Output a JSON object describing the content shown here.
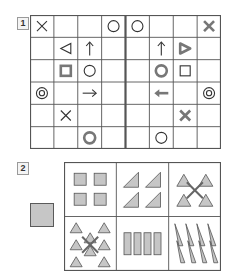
{
  "questions": [
    {
      "number": "1"
    },
    {
      "number": "2"
    }
  ],
  "colors": {
    "line": "#555555",
    "thin_symbol": "#333333",
    "bold_symbol": "#777777",
    "fill": "#c6c6c6"
  },
  "puzzle1": {
    "cols": 8,
    "rows": 6,
    "mirror_divider_after_col": 4,
    "cells": [
      {
        "r": 0,
        "c": 0,
        "sym": "x",
        "style": "thin"
      },
      {
        "r": 0,
        "c": 3,
        "sym": "circle",
        "style": "thin"
      },
      {
        "r": 0,
        "c": 4,
        "sym": "circle",
        "style": "thin"
      },
      {
        "r": 0,
        "c": 7,
        "sym": "x",
        "style": "bold"
      },
      {
        "r": 1,
        "c": 1,
        "sym": "triangle-left",
        "style": "thin"
      },
      {
        "r": 1,
        "c": 2,
        "sym": "arrow-up",
        "style": "thin"
      },
      {
        "r": 1,
        "c": 5,
        "sym": "arrow-up",
        "style": "thin"
      },
      {
        "r": 1,
        "c": 6,
        "sym": "triangle-right",
        "style": "bold"
      },
      {
        "r": 2,
        "c": 1,
        "sym": "square",
        "style": "bold"
      },
      {
        "r": 2,
        "c": 2,
        "sym": "circle",
        "style": "thin"
      },
      {
        "r": 2,
        "c": 5,
        "sym": "circle",
        "style": "bold"
      },
      {
        "r": 2,
        "c": 6,
        "sym": "square",
        "style": "thin"
      },
      {
        "r": 3,
        "c": 0,
        "sym": "double-circle",
        "style": "thin"
      },
      {
        "r": 3,
        "c": 2,
        "sym": "arrow-right",
        "style": "thin"
      },
      {
        "r": 3,
        "c": 5,
        "sym": "arrow-left",
        "style": "bold"
      },
      {
        "r": 3,
        "c": 7,
        "sym": "double-circle",
        "style": "thin"
      },
      {
        "r": 4,
        "c": 1,
        "sym": "x",
        "style": "thin"
      },
      {
        "r": 4,
        "c": 6,
        "sym": "x",
        "style": "bold"
      },
      {
        "r": 5,
        "c": 2,
        "sym": "circle",
        "style": "bold"
      },
      {
        "r": 5,
        "c": 5,
        "sym": "circle",
        "style": "thin"
      }
    ]
  },
  "puzzle2": {
    "sample": "gray-square",
    "cols": 3,
    "rows": 2,
    "cells": [
      {
        "r": 0,
        "c": 0,
        "content": "squares",
        "count": 4
      },
      {
        "r": 0,
        "c": 1,
        "content": "right-triangles",
        "count": 4
      },
      {
        "r": 0,
        "c": 2,
        "content": "triangles-with-x",
        "count": 4
      },
      {
        "r": 1,
        "c": 0,
        "content": "triangles-with-x",
        "count": 8
      },
      {
        "r": 1,
        "c": 1,
        "content": "rectangles",
        "count": 4
      },
      {
        "r": 1,
        "c": 2,
        "content": "tall-triangles",
        "count": 8
      }
    ]
  }
}
